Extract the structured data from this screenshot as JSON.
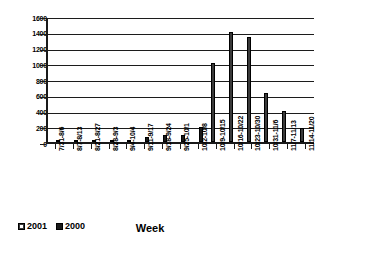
{
  "chart_data": {
    "type": "bar",
    "title": "",
    "xlabel": "Week",
    "ylabel": "",
    "ylim": [
      0,
      1600
    ],
    "ytick_step": 200,
    "yticks": [
      1600,
      1400,
      1200,
      1000,
      800,
      600,
      400,
      200,
      0
    ],
    "grid": true,
    "legend_position": "bottom-left",
    "categories": [
      "7/31-8/6",
      "8/7-8/13",
      "8/21-8/27",
      "8/28-9/3",
      "9/4-10/4",
      "9/11-9/17",
      "9/18-9/24",
      "9/25-10/1",
      "10/2-10/8",
      "10/9-10/15",
      "10/16-10/22",
      "10/23-10/30",
      "10/31-11/6",
      "11/7-11/13",
      "11/14-11/20"
    ],
    "series": [
      {
        "name": "2001",
        "color": "#3a3a3a",
        "values": [
          0,
          0,
          0,
          0,
          0,
          0,
          0,
          0,
          0,
          1000,
          1400,
          1330,
          620,
          390,
          180
        ]
      },
      {
        "name": "2000",
        "color": "#1a1a1a",
        "values": [
          10,
          10,
          10,
          15,
          20,
          60,
          90,
          95,
          185,
          0,
          0,
          0,
          0,
          0,
          0
        ]
      }
    ]
  },
  "axis": {
    "x_title": "Week"
  },
  "legend": {
    "items": [
      {
        "label": "2001",
        "swatch": "legend-swatch-2001"
      },
      {
        "label": "2000",
        "swatch": "legend-swatch-2000"
      }
    ]
  }
}
